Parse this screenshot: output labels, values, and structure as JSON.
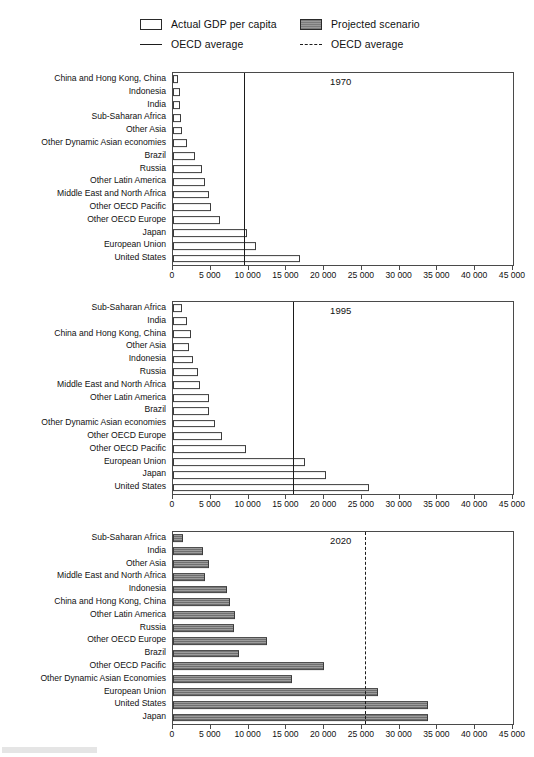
{
  "legend": {
    "items": [
      {
        "type": "swatch-open",
        "label": "Actual GDP per capita",
        "name": "legend-actual-gdp"
      },
      {
        "type": "swatch-filled",
        "label": "Projected scenario",
        "name": "legend-projected-scenario"
      },
      {
        "type": "rule-solid",
        "label": "OECD average",
        "name": "legend-oecd-average-solid"
      },
      {
        "type": "rule-dashed",
        "label": "OECD average",
        "name": "legend-oecd-average-dashed"
      }
    ]
  },
  "axis": {
    "ticks": [
      0,
      5000,
      10000,
      15000,
      20000,
      25000,
      30000,
      35000,
      40000,
      45000
    ],
    "tick_labels": [
      "0",
      "5 000",
      "10 000",
      "15 000",
      "20 000",
      "25 000",
      "30 000",
      "35 000",
      "40 000",
      "45 000"
    ],
    "min": 0,
    "max": 45000
  },
  "colors": {
    "actual_fill": "#ffffff",
    "projected_fill": "#8d8d8d",
    "outline": "#3c3c3c",
    "average_line": "#1b1b1b"
  },
  "chart_data": [
    {
      "type": "bar",
      "orientation": "horizontal",
      "title": "1970",
      "series_name": "Actual GDP per capita",
      "style": "actual",
      "average_label": "OECD average",
      "average_line_style": "solid",
      "average_value": 9400,
      "xlabel": "",
      "ylabel": "",
      "xlim": [
        0,
        45000
      ],
      "grid": false,
      "categories": [
        "China and Hong Kong, China",
        "Indonesia",
        "India",
        "Sub-Saharan Africa",
        "Other Asia",
        "Other Dynamic Asian economies",
        "Brazil",
        "Russia",
        "Other Latin America",
        "Middle East and North Africa",
        "Other OECD Pacific",
        "Other OECD Europe",
        "Japan",
        "European Union",
        "United States"
      ],
      "values": [
        700,
        900,
        900,
        1100,
        1250,
        1900,
        2900,
        3900,
        4200,
        4700,
        5000,
        6200,
        9800,
        11000,
        16800
      ]
    },
    {
      "type": "bar",
      "orientation": "horizontal",
      "title": "1995",
      "series_name": "Actual GDP per capita",
      "style": "actual",
      "average_label": "OECD average",
      "average_line_style": "solid",
      "average_value": 15900,
      "xlabel": "",
      "ylabel": "",
      "xlim": [
        0,
        45000
      ],
      "grid": false,
      "categories": [
        "Sub-Saharan Africa",
        "India",
        "China and Hong Kong, China",
        "Other Asia",
        "Indonesia",
        "Russia",
        "Middle East and North Africa",
        "Other Latin America",
        "Brazil",
        "Other Dynamic Asian economies",
        "Other OECD Europe",
        "Other OECD Pacific",
        "European Union",
        "Japan",
        "United States"
      ],
      "values": [
        1150,
        1800,
        2400,
        2100,
        2700,
        3300,
        3600,
        4800,
        4700,
        5600,
        6500,
        9700,
        17500,
        20300,
        25900
      ]
    },
    {
      "type": "bar",
      "orientation": "horizontal",
      "title": "2020",
      "series_name": "Projected scenario",
      "style": "projected",
      "average_label": "OECD average",
      "average_line_style": "dashed",
      "average_value": 25400,
      "xlabel": "",
      "ylabel": "",
      "xlim": [
        0,
        45000
      ],
      "grid": false,
      "categories": [
        "Sub-Saharan Africa",
        "India",
        "Other Asia",
        "Middle East and North Africa",
        "Indonesia",
        "China and Hong Kong, China",
        "Other Latin America",
        "Russia",
        "Other OECD Europe",
        "Brazil",
        "Other OECD Pacific",
        "Other Dynamic Asian Economies",
        "European Union",
        "United States",
        "Japan"
      ],
      "values": [
        1300,
        4000,
        4800,
        4300,
        7100,
        7600,
        8200,
        8100,
        12400,
        8700,
        20000,
        15800,
        27100,
        33800,
        33800
      ]
    }
  ]
}
